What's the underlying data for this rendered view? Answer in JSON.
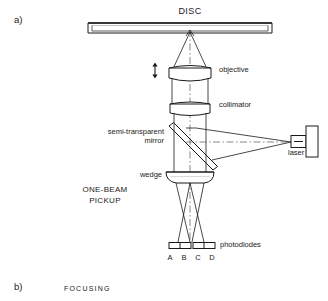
{
  "figure": {
    "panel_a_label": "a)",
    "panel_b_label": "b)",
    "panel_b_title": "FOCUSING",
    "pickup_label_line1": "ONE-BEAM",
    "pickup_label_line2": "PICKUP"
  },
  "components": {
    "disc": "DISC",
    "objective": "objective",
    "collimator": "collimator",
    "semi_transparent_mirror_line1": "semi-transparent",
    "semi_transparent_mirror_line2": "mirror",
    "wedge": "wedge",
    "laser": "laser",
    "photodiodes": "photodiodes"
  },
  "photodiode_labels": [
    "A",
    "B",
    "C",
    "D"
  ],
  "colors": {
    "line": "#1a1a1a",
    "background": "#ffffff",
    "text": "#1a1a1a"
  }
}
